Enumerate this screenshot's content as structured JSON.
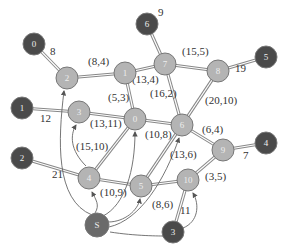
{
  "diagram": {
    "type": "network-flow-graph",
    "colors": {
      "dark_node": "#4a4a4a",
      "light_node": "#b4b4b4",
      "source_node": "#6a6a6a",
      "edge": "#888888",
      "arrow": "#555555"
    },
    "dark_nodes": [
      {
        "id": "d0",
        "label": "0",
        "x": 34,
        "y": 44
      },
      {
        "id": "d6",
        "label": "6",
        "x": 147,
        "y": 24
      },
      {
        "id": "d5",
        "label": "5",
        "x": 266,
        "y": 57
      },
      {
        "id": "d1",
        "label": "1",
        "x": 22,
        "y": 108
      },
      {
        "id": "d4",
        "label": "4",
        "x": 266,
        "y": 143
      },
      {
        "id": "d2",
        "label": "2",
        "x": 22,
        "y": 158
      },
      {
        "id": "d3",
        "label": "3",
        "x": 173,
        "y": 232
      }
    ],
    "source_node": {
      "id": "S",
      "label": "S",
      "x": 97,
      "y": 225
    },
    "light_nodes": [
      {
        "id": "n2",
        "label": "2",
        "x": 67,
        "y": 78
      },
      {
        "id": "n1",
        "label": "1",
        "x": 125,
        "y": 73
      },
      {
        "id": "n7",
        "label": "7",
        "x": 165,
        "y": 64
      },
      {
        "id": "n8",
        "label": "8",
        "x": 218,
        "y": 71
      },
      {
        "id": "n3",
        "label": "3",
        "x": 79,
        "y": 112
      },
      {
        "id": "n0",
        "label": "0",
        "x": 135,
        "y": 119
      },
      {
        "id": "n6",
        "label": "6",
        "x": 182,
        "y": 125
      },
      {
        "id": "n9",
        "label": "9",
        "x": 223,
        "y": 150
      },
      {
        "id": "n4",
        "label": "4",
        "x": 89,
        "y": 178
      },
      {
        "id": "n5",
        "label": "5",
        "x": 141,
        "y": 186
      },
      {
        "id": "n10",
        "label": "10",
        "x": 188,
        "y": 180
      }
    ],
    "edges": [
      {
        "from": "d0",
        "to": "n2",
        "label": "8",
        "lx": 50,
        "ly": 55
      },
      {
        "from": "n2",
        "to": "n1",
        "label": "(8,4)",
        "lx": 88,
        "ly": 65
      },
      {
        "from": "d6",
        "to": "n7",
        "label": "9",
        "lx": 158,
        "ly": 16
      },
      {
        "from": "n1",
        "to": "n7",
        "label": "(13,4)",
        "lx": 132,
        "ly": 83
      },
      {
        "from": "n7",
        "to": "n8",
        "label": "(15,5)",
        "lx": 182,
        "ly": 55
      },
      {
        "from": "n8",
        "to": "d5",
        "label": "19",
        "lx": 235,
        "ly": 72
      },
      {
        "from": "n1",
        "to": "n0",
        "label": "(5,3)",
        "lx": 108,
        "ly": 101
      },
      {
        "from": "n7",
        "to": "n6",
        "label": "(16,2)",
        "lx": 150,
        "ly": 97
      },
      {
        "from": "n8",
        "to": "n6",
        "label": "(20,10)",
        "lx": 205,
        "ly": 104
      },
      {
        "from": "d1",
        "to": "n3",
        "label": "12",
        "lx": 40,
        "ly": 122
      },
      {
        "from": "n3",
        "to": "n0",
        "label": "(13,11)",
        "lx": 90,
        "ly": 127
      },
      {
        "from": "n0",
        "to": "n6",
        "label": "(10,8)",
        "lx": 145,
        "ly": 138
      },
      {
        "from": "n6",
        "to": "n9",
        "label": "(6,4)",
        "lx": 202,
        "ly": 133
      },
      {
        "from": "n9",
        "to": "d4",
        "label": "7",
        "lx": 243,
        "ly": 159
      },
      {
        "from": "n4",
        "to": "n0",
        "label": "",
        "lx": 0,
        "ly": 0
      },
      {
        "from": "d2",
        "to": "n4",
        "label": "21",
        "lx": 52,
        "ly": 178
      },
      {
        "from": "n4",
        "to": "n5",
        "label": "(10,9)",
        "lx": 100,
        "ly": 196
      },
      {
        "from": "n5",
        "to": "n6",
        "label": "(13,6)",
        "lx": 170,
        "ly": 158
      },
      {
        "from": "n5",
        "to": "n10",
        "label": "(8,6)",
        "lx": 152,
        "ly": 208
      },
      {
        "from": "n10",
        "to": "n9",
        "label": "(3,5)",
        "lx": 205,
        "ly": 180
      },
      {
        "from": "d3",
        "to": "n10",
        "label": "11",
        "lx": 180,
        "ly": 214
      }
    ],
    "extra_labels": [
      {
        "label": "(15,10)",
        "lx": 76,
        "ly": 150
      }
    ]
  }
}
